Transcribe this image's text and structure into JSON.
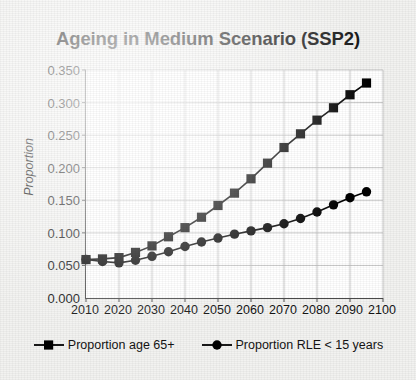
{
  "chart_data": {
    "type": "line",
    "title": "Ageing in Medium Scenario (SSP2)",
    "xlabel": "",
    "ylabel": "Proportion",
    "xlim": [
      2010,
      2100
    ],
    "ylim": [
      0.0,
      0.35
    ],
    "grid": true,
    "legend_position": "bottom",
    "x_ticks": [
      2010,
      2020,
      2030,
      2040,
      2050,
      2060,
      2070,
      2080,
      2090,
      2100
    ],
    "y_ticks": [
      "0.000",
      "0.050",
      "0.100",
      "0.150",
      "0.200",
      "0.250",
      "0.300",
      "0.350"
    ],
    "y_tick_values": [
      0.0,
      0.05,
      0.1,
      0.15,
      0.2,
      0.25,
      0.3,
      0.35
    ],
    "x": [
      2010,
      2015,
      2020,
      2025,
      2030,
      2035,
      2040,
      2045,
      2050,
      2055,
      2060,
      2065,
      2070,
      2075,
      2080,
      2085,
      2090,
      2095
    ],
    "series": [
      {
        "name": "Proportion age 65+",
        "marker": "square",
        "color": "#000000",
        "values": [
          0.059,
          0.06,
          0.062,
          0.07,
          0.08,
          0.094,
          0.108,
          0.124,
          0.142,
          0.161,
          0.183,
          0.207,
          0.231,
          0.252,
          0.273,
          0.292,
          0.312,
          0.33
        ]
      },
      {
        "name": "Proportion RLE < 15 years",
        "marker": "circle",
        "color": "#000000",
        "values": [
          0.059,
          0.056,
          0.054,
          0.058,
          0.064,
          0.071,
          0.079,
          0.086,
          0.092,
          0.098,
          0.103,
          0.108,
          0.114,
          0.122,
          0.132,
          0.143,
          0.154,
          0.163
        ]
      }
    ]
  },
  "legend": {
    "items": [
      {
        "label": "Proportion age 65+",
        "marker": "square"
      },
      {
        "label": "Proportion RLE < 15 years",
        "marker": "circle"
      }
    ]
  }
}
